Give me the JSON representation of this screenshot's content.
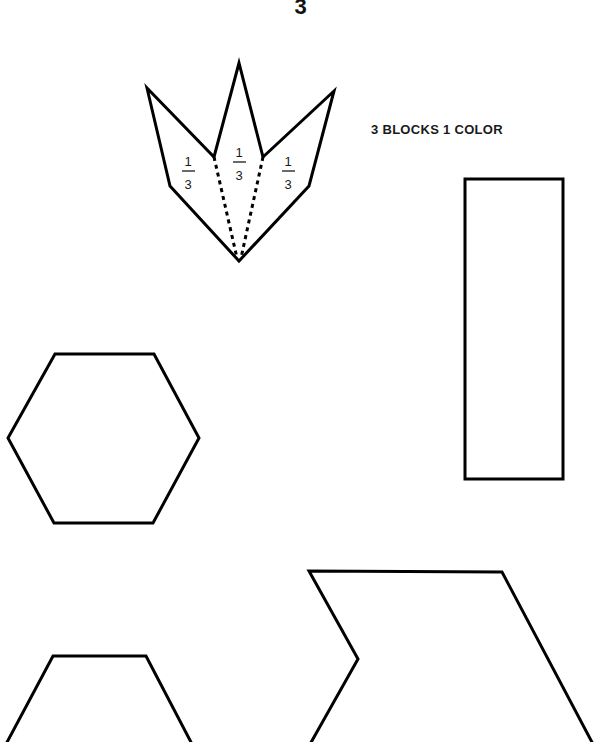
{
  "page": {
    "number": "3",
    "caption": "3 BLOCKS 1 COLOR"
  },
  "figure": {
    "crown_shape": {
      "sections": [
        {
          "numerator": "1",
          "denominator": "3"
        },
        {
          "numerator": "1",
          "denominator": "3"
        },
        {
          "numerator": "1",
          "denominator": "3"
        }
      ]
    },
    "shapes": [
      "crown",
      "rectangle",
      "hexagon",
      "trapezoid",
      "chevron-parallelogram"
    ],
    "stroke_color": "#000000",
    "background": "#ffffff"
  }
}
